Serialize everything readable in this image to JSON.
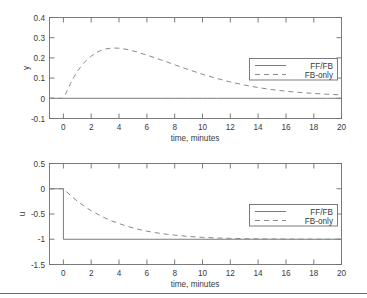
{
  "figure": {
    "background_color": "#ffffff",
    "line_color": "#7b7b7b",
    "text_color": "#3a3a3a",
    "frame_color": "#6e6e6e",
    "bottom_rule": true
  },
  "chart_data": [
    {
      "type": "line",
      "id": "output-response",
      "title": "",
      "xlabel": "time, minutes",
      "ylabel": "y",
      "xlim": [
        -1,
        20
      ],
      "ylim": [
        -0.1,
        0.4
      ],
      "xticks": [
        0,
        2,
        4,
        6,
        8,
        10,
        12,
        14,
        16,
        18,
        20
      ],
      "xticklabels": [
        "0",
        "2",
        "4",
        "6",
        "8",
        "10",
        "12",
        "14",
        "16",
        "18",
        "20"
      ],
      "yticks": [
        -0.1,
        0,
        0.1,
        0.2,
        0.3,
        0.4
      ],
      "yticklabels": [
        "-0.1",
        "0",
        "0.1",
        "0.2",
        "0.3",
        "0.4"
      ],
      "grid": false,
      "legend_position": "right",
      "series": [
        {
          "name": "FF/FB",
          "style": "solid",
          "x": [
            -1,
            0,
            1,
            2,
            3,
            4,
            5,
            6,
            7,
            8,
            9,
            10,
            11,
            12,
            13,
            14,
            15,
            16,
            17,
            18,
            19,
            20
          ],
          "values": [
            0,
            0,
            0,
            0,
            0,
            0,
            0,
            0,
            0,
            0,
            0,
            0,
            0,
            0,
            0,
            0,
            0,
            0,
            0,
            0,
            0,
            0
          ]
        },
        {
          "name": "FB-only",
          "style": "dashed",
          "x": [
            -1,
            0,
            0.25,
            0.5,
            0.75,
            1,
            1.5,
            2,
            2.5,
            3,
            3.5,
            4,
            4.5,
            5,
            6,
            7,
            8,
            9,
            10,
            11,
            12,
            13,
            14,
            15,
            16,
            17,
            18,
            19,
            20
          ],
          "values": [
            0,
            0,
            0.035,
            0.072,
            0.105,
            0.134,
            0.178,
            0.209,
            0.231,
            0.244,
            0.249,
            0.248,
            0.243,
            0.235,
            0.214,
            0.191,
            0.166,
            0.142,
            0.119,
            0.099,
            0.081,
            0.066,
            0.053,
            0.043,
            0.035,
            0.029,
            0.024,
            0.02,
            0.017
          ]
        }
      ]
    },
    {
      "type": "line",
      "id": "control-effort",
      "title": "",
      "xlabel": "time, minutes",
      "ylabel": "u",
      "xlim": [
        -1,
        20
      ],
      "ylim": [
        -1.5,
        0.5
      ],
      "xticks": [
        0,
        2,
        4,
        6,
        8,
        10,
        12,
        14,
        16,
        18,
        20
      ],
      "xticklabels": [
        "0",
        "2",
        "4",
        "6",
        "8",
        "10",
        "12",
        "14",
        "16",
        "18",
        "20"
      ],
      "yticks": [
        -1.5,
        -1,
        -0.5,
        0,
        0.5
      ],
      "yticklabels": [
        "-1.5",
        "-1",
        "-0.5",
        "0",
        "0.5"
      ],
      "grid": false,
      "legend_position": "right",
      "series": [
        {
          "name": "FF/FB",
          "style": "solid",
          "x": [
            -1,
            0,
            0,
            20
          ],
          "values": [
            0,
            0,
            -1,
            -1
          ]
        },
        {
          "name": "FB-only",
          "style": "dashed",
          "x": [
            -1,
            0,
            0.5,
            1,
            1.5,
            2,
            2.5,
            3,
            3.5,
            4,
            4.5,
            5,
            5.5,
            6,
            6.5,
            7,
            7.5,
            8,
            9,
            10,
            11,
            12,
            13,
            14,
            15,
            16,
            17,
            18,
            19,
            20
          ],
          "values": [
            0,
            0,
            -0.13,
            -0.245,
            -0.345,
            -0.435,
            -0.51,
            -0.58,
            -0.64,
            -0.69,
            -0.735,
            -0.775,
            -0.81,
            -0.84,
            -0.865,
            -0.885,
            -0.903,
            -0.918,
            -0.944,
            -0.962,
            -0.974,
            -0.982,
            -0.988,
            -0.992,
            -0.995,
            -0.996,
            -0.998,
            -0.999,
            -0.999,
            -1.0
          ]
        }
      ]
    }
  ],
  "legend": {
    "entries": [
      {
        "label": "FF/FB",
        "style": "solid"
      },
      {
        "label": "FB-only",
        "style": "dashed"
      }
    ]
  }
}
